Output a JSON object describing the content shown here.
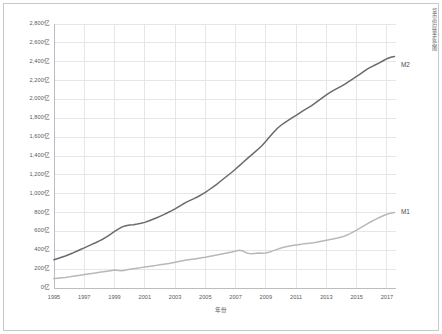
{
  "chart_data": {
    "type": "line",
    "title": "",
    "xlabel": "年份",
    "ylabel": "",
    "unit_suffix": "亿",
    "grid": true,
    "legend_position": "right-inline",
    "xlim": [
      1995,
      2017.6
    ],
    "ylim": [
      0,
      2800
    ],
    "ytick_values": [
      0,
      200,
      400,
      600,
      800,
      1000,
      1200,
      1400,
      1600,
      1800,
      2000,
      2200,
      2400,
      2600,
      2800
    ],
    "ytick_labels": [
      "0亿",
      "200亿",
      "400亿",
      "600亿",
      "800亿",
      "1,000亿",
      "1,200亿",
      "1,400亿",
      "1,600亿",
      "1,800亿",
      "2,000亿",
      "2,200亿",
      "2,400亿",
      "2,600亿",
      "2,800亿"
    ],
    "xtick_values": [
      1995,
      1997,
      1999,
      2001,
      2003,
      2005,
      2007,
      2009,
      2011,
      2013,
      2015,
      2017
    ],
    "xtick_labels": [
      "1995",
      "1997",
      "1999",
      "2001",
      "2003",
      "2005",
      "2007",
      "2009",
      "2011",
      "2013",
      "2015",
      "2017"
    ],
    "series": [
      {
        "name": "M2",
        "label": "M2",
        "color": "#6b6b6e",
        "x": [
          1995.0,
          1995.25,
          1995.5,
          1995.75,
          1996.0,
          1996.25,
          1996.5,
          1996.75,
          1997.0,
          1997.25,
          1997.5,
          1997.75,
          1998.0,
          1998.25,
          1998.5,
          1998.75,
          1999.0,
          1999.25,
          1999.5,
          1999.75,
          2000.0,
          2000.25,
          2000.5,
          2000.75,
          2001.0,
          2001.25,
          2001.5,
          2001.75,
          2002.0,
          2002.25,
          2002.5,
          2002.75,
          2003.0,
          2003.25,
          2003.5,
          2003.75,
          2004.0,
          2004.25,
          2004.5,
          2004.75,
          2005.0,
          2005.25,
          2005.5,
          2005.75,
          2006.0,
          2006.25,
          2006.5,
          2006.75,
          2007.0,
          2007.25,
          2007.5,
          2007.75,
          2008.0,
          2008.25,
          2008.5,
          2008.75,
          2009.0,
          2009.25,
          2009.5,
          2009.75,
          2010.0,
          2010.25,
          2010.5,
          2010.75,
          2011.0,
          2011.25,
          2011.5,
          2011.75,
          2012.0,
          2012.25,
          2012.5,
          2012.75,
          2013.0,
          2013.25,
          2013.5,
          2013.75,
          2014.0,
          2014.25,
          2014.5,
          2014.75,
          2015.0,
          2015.25,
          2015.5,
          2015.75,
          2016.0,
          2016.25,
          2016.5,
          2016.75,
          2017.0,
          2017.25,
          2017.5
        ],
        "values": [
          300,
          312,
          326,
          340,
          356,
          372,
          390,
          408,
          426,
          444,
          462,
          480,
          500,
          520,
          545,
          572,
          600,
          625,
          648,
          660,
          668,
          672,
          678,
          686,
          696,
          710,
          726,
          742,
          760,
          778,
          798,
          818,
          840,
          864,
          888,
          910,
          930,
          948,
          968,
          990,
          1015,
          1042,
          1070,
          1100,
          1132,
          1164,
          1196,
          1228,
          1262,
          1298,
          1334,
          1370,
          1404,
          1438,
          1474,
          1512,
          1556,
          1604,
          1650,
          1692,
          1726,
          1754,
          1780,
          1806,
          1832,
          1858,
          1884,
          1908,
          1932,
          1960,
          1990,
          2020,
          2048,
          2074,
          2098,
          2120,
          2142,
          2166,
          2192,
          2218,
          2244,
          2272,
          2300,
          2326,
          2348,
          2368,
          2388,
          2410,
          2432,
          2448,
          2455
        ]
      },
      {
        "name": "M1",
        "label": "M1",
        "color": "#b8b8bb",
        "x": [
          1995.0,
          1995.25,
          1995.5,
          1995.75,
          1996.0,
          1996.25,
          1996.5,
          1996.75,
          1997.0,
          1997.25,
          1997.5,
          1997.75,
          1998.0,
          1998.25,
          1998.5,
          1998.75,
          1999.0,
          1999.25,
          1999.5,
          1999.75,
          2000.0,
          2000.25,
          2000.5,
          2000.75,
          2001.0,
          2001.25,
          2001.5,
          2001.75,
          2002.0,
          2002.25,
          2002.5,
          2002.75,
          2003.0,
          2003.25,
          2003.5,
          2003.75,
          2004.0,
          2004.25,
          2004.5,
          2004.75,
          2005.0,
          2005.25,
          2005.5,
          2005.75,
          2006.0,
          2006.25,
          2006.5,
          2006.75,
          2007.0,
          2007.25,
          2007.5,
          2007.75,
          2008.0,
          2008.25,
          2008.5,
          2008.75,
          2009.0,
          2009.25,
          2009.5,
          2009.75,
          2010.0,
          2010.25,
          2010.5,
          2010.75,
          2011.0,
          2011.25,
          2011.5,
          2011.75,
          2012.0,
          2012.25,
          2012.5,
          2012.75,
          2013.0,
          2013.25,
          2013.5,
          2013.75,
          2014.0,
          2014.25,
          2014.5,
          2014.75,
          2015.0,
          2015.25,
          2015.5,
          2015.75,
          2016.0,
          2016.25,
          2016.5,
          2016.75,
          2017.0,
          2017.25,
          2017.5
        ],
        "values": [
          100,
          104,
          108,
          112,
          118,
          124,
          130,
          136,
          142,
          148,
          154,
          160,
          166,
          172,
          178,
          184,
          190,
          186,
          184,
          190,
          198,
          204,
          210,
          216,
          222,
          228,
          234,
          240,
          246,
          252,
          258,
          264,
          272,
          280,
          288,
          296,
          302,
          308,
          314,
          320,
          326,
          334,
          342,
          350,
          358,
          366,
          374,
          382,
          392,
          400,
          392,
          370,
          362,
          366,
          370,
          368,
          372,
          382,
          396,
          410,
          424,
          434,
          442,
          450,
          456,
          462,
          468,
          472,
          476,
          482,
          490,
          498,
          506,
          514,
          522,
          530,
          540,
          554,
          572,
          592,
          614,
          638,
          662,
          686,
          708,
          728,
          748,
          766,
          782,
          794,
          800
        ]
      }
    ]
  },
  "labels": {
    "series_m2": "M2",
    "series_m1": "M1",
    "xaxis_title": "年份",
    "side_caption": "货币供应量走势图"
  }
}
